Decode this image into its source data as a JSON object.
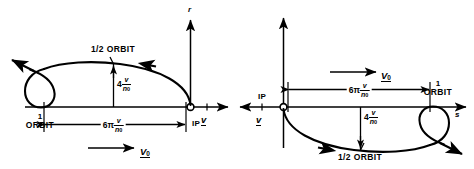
{
  "figure": {
    "type": "orbit-trajectory-diagram",
    "panel_count": 2,
    "ink_color": "#000000",
    "background": "#ffffff"
  },
  "left_panel": {
    "name": "left-orbit-diagram",
    "vertical_axis_label": "r",
    "horizontal_axis_label": "v",
    "ip_label": "IP",
    "half_orbit_label": "1/2 ORBIT",
    "orbit_count_label": "1",
    "orbit_word": "ORBIT",
    "height_dimension": {
      "coefficient": "4",
      "numerator": "v",
      "denominator": "n",
      "denominator_sub": "0"
    },
    "length_dimension": {
      "coefficient": "6π",
      "numerator": "v",
      "denominator": "n",
      "denominator_sub": "0"
    },
    "velocity_vector_label": {
      "symbol": "V",
      "sub": "0"
    },
    "direction": "leftward-above-axis"
  },
  "right_panel": {
    "name": "right-orbit-diagram",
    "vertical_axis_label": "",
    "horizontal_axis_label": "s",
    "velocity_axis_label": "v",
    "ip_label": "IP",
    "half_orbit_label": "1/2 ORBIT",
    "orbit_count_label": "1",
    "orbit_word": "ORBIT",
    "height_dimension": {
      "coefficient": "4",
      "numerator": "v",
      "denominator": "n",
      "denominator_sub": "0"
    },
    "length_dimension": {
      "coefficient": "6π",
      "numerator": "v",
      "denominator": "n",
      "denominator_sub": "0"
    },
    "velocity_vector_label": {
      "symbol": "V",
      "sub": "0"
    },
    "direction": "rightward-below-axis"
  }
}
